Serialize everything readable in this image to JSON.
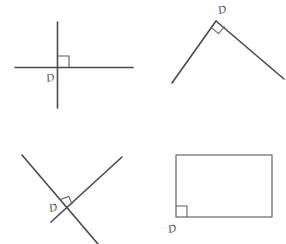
{
  "page": {
    "background_color": "#ffffff",
    "ink_color": "#4a4a4a",
    "width": 286,
    "height": 244
  },
  "figures": [
    {
      "id": "figure-crossed-perpendicular-lines",
      "name": "perpendicular-intersecting-lines",
      "label": "D",
      "description": "A vertical line and a horizontal line crossing at a right angle",
      "label_position": {
        "x": 47,
        "y": 82
      },
      "right_angle_marker": "square"
    },
    {
      "id": "figure-vertex-angle",
      "name": "right-angle-rays",
      "label": "D",
      "description": "Two rays meeting at an apex forming a right angle",
      "label_position": {
        "x": 218,
        "y": 13
      },
      "right_angle_marker": "rotated-square"
    },
    {
      "id": "figure-oblique-crossing-lines",
      "name": "oblique-perpendicular-lines",
      "label": "D",
      "description": "Two slanted lines crossing at a right angle",
      "label_position": {
        "x": 49,
        "y": 210
      },
      "right_angle_marker": "rotated-square"
    },
    {
      "id": "figure-rectangle",
      "name": "rectangle-corner-angle",
      "label": "D",
      "description": "A rectangle with the bottom-left corner right angle marked",
      "label_position": {
        "x": 170,
        "y": 232
      },
      "right_angle_marker": "square"
    }
  ],
  "geometry": {
    "figure1": {
      "vertical_line": {
        "x1": 57.5,
        "y1": 22,
        "x2": 57.5,
        "y2": 108
      },
      "horizontal_line": {
        "x1": 15,
        "y1": 67.5,
        "x2": 133,
        "y2": 67.5
      },
      "marker": {
        "x": 58,
        "y": 55,
        "size": 11
      }
    },
    "figure2": {
      "apex": {
        "x": 216,
        "y": 21
      },
      "left_ray_end": {
        "x": 172,
        "y": 83
      },
      "right_ray_end": {
        "x": 284,
        "y": 79
      },
      "marker_size": 11
    },
    "figure3": {
      "line_a": {
        "x1": 22,
        "y1": 155,
        "x2": 98,
        "y2": 244
      },
      "line_b": {
        "x1": 51,
        "y1": 222,
        "x2": 122,
        "y2": 157
      },
      "intersection": {
        "x": 68,
        "y": 207
      },
      "marker_size": 11
    },
    "figure4": {
      "rect": {
        "x": 176,
        "y": 155,
        "width": 96,
        "height": 62
      },
      "marker": {
        "x": 176,
        "y": 206,
        "size": 11
      }
    }
  }
}
